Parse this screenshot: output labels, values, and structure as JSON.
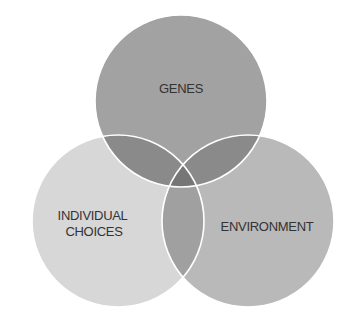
{
  "diagram": {
    "type": "venn",
    "sets": [
      {
        "id": "genes",
        "label": "GENES",
        "lines": [
          "GENES"
        ],
        "color": "#a2a2a2"
      },
      {
        "id": "individual_choices",
        "label": "INDIVIDUAL CHOICES",
        "lines": [
          "INDIVIDUAL",
          "CHOICES"
        ],
        "color": "#d7d7d7"
      },
      {
        "id": "environment",
        "label": "ENVIRONMENT",
        "lines": [
          "ENVIRONMENT"
        ],
        "color": "#b9b9b9"
      }
    ],
    "overlaps": {
      "genes_choices": "#8a8a8a",
      "genes_environment": "#8a8a8a",
      "choices_environment": "#a0a0a0",
      "all": "#767676"
    },
    "stroke_color": "#ffffff"
  }
}
